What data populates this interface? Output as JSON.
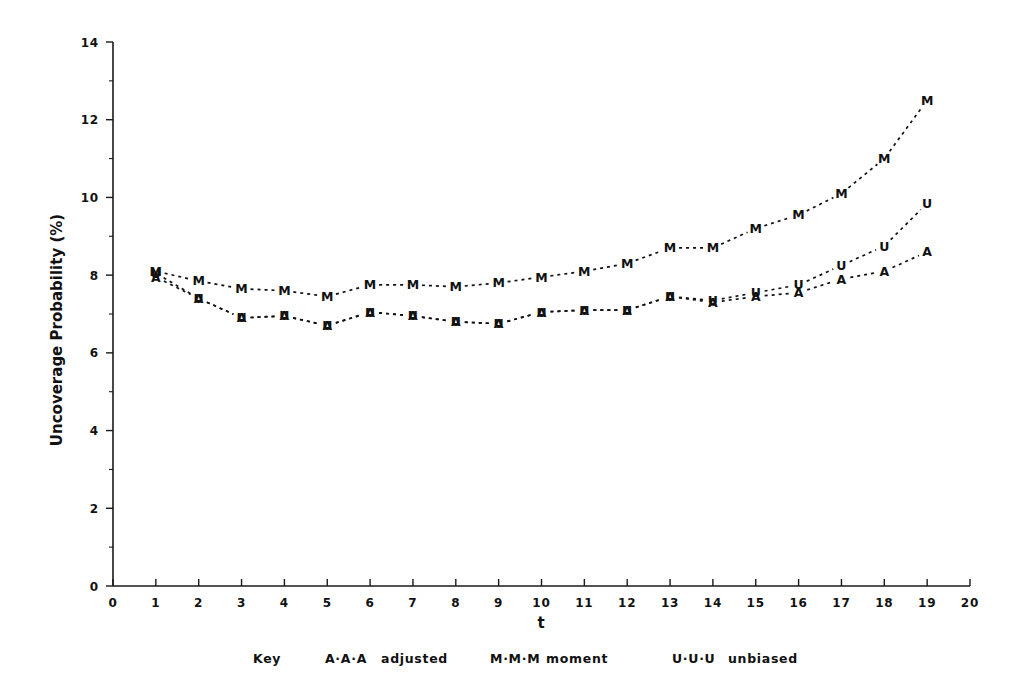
{
  "chart_data": {
    "type": "line",
    "title": "",
    "xlabel": "t",
    "ylabel": "Uncoverage Probability (%)",
    "xlim": [
      0,
      20
    ],
    "ylim": [
      0,
      14
    ],
    "grid": false,
    "legend_position": "below-axis",
    "legend_key_label": "Key",
    "x_major_ticks": [
      0,
      1,
      2,
      3,
      4,
      5,
      6,
      7,
      8,
      9,
      10,
      11,
      12,
      13,
      14,
      15,
      16,
      17,
      18,
      19,
      20
    ],
    "x_tick_labels": [
      "0",
      "1",
      "2",
      "3",
      "4",
      "5",
      "6",
      "7",
      "8",
      "9",
      "10",
      "11",
      "12",
      "13",
      "14",
      "15",
      "16",
      "17",
      "18",
      "19",
      "20"
    ],
    "y_major_ticks": [
      0,
      2,
      4,
      6,
      8,
      10,
      12,
      14
    ],
    "y_tick_labels": [
      "0",
      "2",
      "4",
      "6",
      "8",
      "10",
      "12",
      "14"
    ],
    "y_minor_ticks": [
      1,
      3,
      5,
      7,
      9,
      11,
      13
    ],
    "x": [
      1,
      2,
      3,
      4,
      5,
      6,
      7,
      8,
      9,
      10,
      11,
      12,
      13,
      14,
      15,
      16,
      17,
      18,
      19
    ],
    "series": [
      {
        "name": "adjusted",
        "marker": "A",
        "legend_sample": "A·A·A",
        "legend_label": "adjusted",
        "linestyle": "dotted",
        "values": [
          7.95,
          7.4,
          6.9,
          6.95,
          6.7,
          7.05,
          6.95,
          6.8,
          6.75,
          7.05,
          7.1,
          7.1,
          7.45,
          7.3,
          7.45,
          7.55,
          7.9,
          8.1,
          8.6
        ]
      },
      {
        "name": "moment",
        "marker": "M",
        "legend_sample": "M·M·M",
        "legend_label": "moment",
        "linestyle": "dotted",
        "values": [
          8.1,
          7.85,
          7.65,
          7.6,
          7.45,
          7.75,
          7.75,
          7.7,
          7.8,
          7.95,
          8.1,
          8.3,
          8.7,
          8.7,
          9.2,
          9.55,
          10.1,
          11.0,
          12.5
        ]
      },
      {
        "name": "unbiased",
        "marker": "U",
        "legend_sample": "U·U·U",
        "legend_label": "unbiased",
        "linestyle": "dotted",
        "values": [
          8.05,
          7.4,
          6.9,
          6.95,
          6.7,
          7.05,
          6.95,
          6.8,
          6.75,
          7.05,
          7.1,
          7.1,
          7.45,
          7.35,
          7.55,
          7.75,
          8.25,
          8.75,
          9.85
        ]
      }
    ]
  },
  "axes": {
    "y_title": "Uncoverage Probability (%)",
    "x_title": "t"
  },
  "legend": {
    "key": "Key",
    "entries": [
      {
        "sample": "A·A·A",
        "label": "adjusted"
      },
      {
        "sample": "M·M·M",
        "label": "moment"
      },
      {
        "sample": "U·U·U",
        "label": "unbiased"
      }
    ]
  },
  "colors": {
    "ink": "#111111",
    "background": "#ffffff"
  }
}
